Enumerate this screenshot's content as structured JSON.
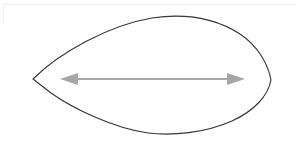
{
  "figure": {
    "title": "Lens shape with horizontal double-headed dimension arrow",
    "canvas": {
      "width": 297,
      "height": 147,
      "background_color": "#ffffff"
    },
    "frame": {
      "visible": true,
      "color": "#f0f0f2",
      "top_rule_y": 4,
      "left_rule_height": 20
    },
    "shape": {
      "name": "lens-outline",
      "type": "closed-curve",
      "stroke_color": "#353535",
      "fill_color": "#ffffff",
      "stroke_width": 1.15,
      "left_vertex": {
        "x": 33,
        "y": 79
      },
      "right_vertex": {
        "x": 271,
        "y": 80
      },
      "top_apex": {
        "x": 168,
        "y": 17
      },
      "bottom_apex": {
        "x": 150,
        "y": 133
      },
      "path": "M 33 79 C 60 52 110 25 152 18 C 186 13 215 18 240 34 C 258 46 268 64 271 80 C 268 96 254 111 232 121 C 205 133 172 136 148 133 C 113 128 72 108 51 93 Z"
    },
    "arrow": {
      "name": "dimension-arrow",
      "type": "double-headed",
      "color": "#a6a6a6",
      "shaft": {
        "y": 79,
        "x_start": 72,
        "x_end": 233,
        "stroke_width": 2.1
      },
      "left_head": {
        "tip": {
          "x": 60,
          "y": 79
        },
        "base_x": 78,
        "half_height": 6
      },
      "right_head": {
        "tip": {
          "x": 245,
          "y": 79
        },
        "base_x": 227,
        "half_height": 6
      }
    },
    "labels": []
  },
  "chart_data": {
    "type": "diagram",
    "title": "Lens shape with horizontal double-headed dimension arrow",
    "xlabel": "",
    "ylabel": "",
    "annotations": [
      {
        "kind": "outline",
        "label": "lens outline",
        "stroke": "#353535"
      },
      {
        "kind": "dimension-arrow",
        "label": "horizontal width arrow",
        "stroke": "#a6a6a6",
        "from_x": 60,
        "to_x": 245,
        "y": 79
      }
    ]
  }
}
